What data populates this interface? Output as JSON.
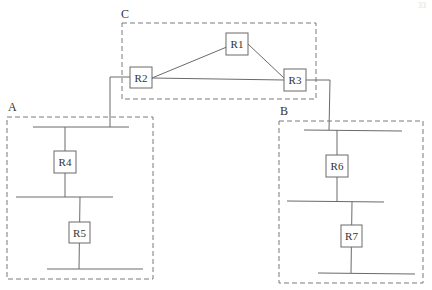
{
  "diagram": {
    "type": "network-topology",
    "corner_mark": "33",
    "areas": [
      {
        "id": "C",
        "label": "C",
        "routers": [
          "R1",
          "R2",
          "R3"
        ]
      },
      {
        "id": "A",
        "label": "A",
        "routers": [
          "R4",
          "R5"
        ]
      },
      {
        "id": "B",
        "label": "B",
        "routers": [
          "R6",
          "R7"
        ]
      }
    ],
    "routers": {
      "R1": {
        "label": "R1"
      },
      "R2": {
        "label": "R2"
      },
      "R3": {
        "label": "R3"
      },
      "R4": {
        "label": "R4"
      },
      "R5": {
        "label": "R5"
      },
      "R6": {
        "label": "R6"
      },
      "R7": {
        "label": "R7"
      }
    },
    "links": [
      {
        "from": "R1",
        "to": "R2"
      },
      {
        "from": "R1",
        "to": "R3"
      },
      {
        "from": "R2",
        "to": "R3"
      },
      {
        "from": "R2",
        "to": "A-segment-1"
      },
      {
        "from": "R3",
        "to": "B-segment-1"
      },
      {
        "from": "R4",
        "to": "A-segment-1"
      },
      {
        "from": "R4",
        "to": "A-segment-2"
      },
      {
        "from": "R5",
        "to": "A-segment-2"
      },
      {
        "from": "R5",
        "to": "A-segment-3"
      },
      {
        "from": "R6",
        "to": "B-segment-1"
      },
      {
        "from": "R6",
        "to": "B-segment-2"
      },
      {
        "from": "R7",
        "to": "B-segment-2"
      },
      {
        "from": "R7",
        "to": "B-segment-3"
      }
    ]
  }
}
